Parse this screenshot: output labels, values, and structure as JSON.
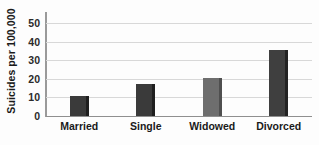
{
  "chart_data": {
    "type": "bar",
    "title": "",
    "xlabel": "",
    "ylabel": "Suicides per 100,000",
    "categories": [
      "Married",
      "Single",
      "Widowed",
      "Divorced"
    ],
    "values": [
      11,
      17,
      20.5,
      35.5
    ],
    "ylim": [
      0,
      55
    ],
    "yticks": [
      0,
      10,
      20,
      30,
      40,
      50
    ],
    "ytick_labels": [
      "0",
      "10",
      "20",
      "30",
      "40",
      "50"
    ],
    "grid": true,
    "legend": false,
    "bar_colors": [
      "#3a3a3a",
      "#3a3a3a",
      "#6e6e6e",
      "#3f3f3f"
    ],
    "bar_edge_colors": [
      "#1f1f1f",
      "#1f1f1f",
      "#4f4f4f",
      "#232323"
    ],
    "background_color": "#fdfdfd",
    "gridline_color": "#d8d8d8",
    "axis_color": "#9a9a9a"
  }
}
